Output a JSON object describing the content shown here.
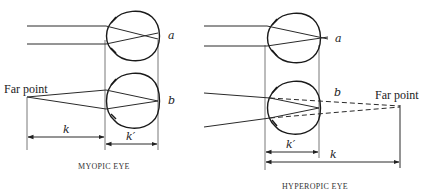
{
  "myopic": {
    "caption": "MYOPIC EYE",
    "top_label": "a",
    "bottom_label": "b",
    "far_point_label": "Far point",
    "dim_k": "k",
    "dim_k_prime": "k′"
  },
  "hyperopic": {
    "caption": "HYPEROPIC EYE",
    "top_label": "a",
    "bottom_label": "b",
    "far_point_label": "Far point",
    "dim_k": "k",
    "dim_k_prime": "k′"
  }
}
